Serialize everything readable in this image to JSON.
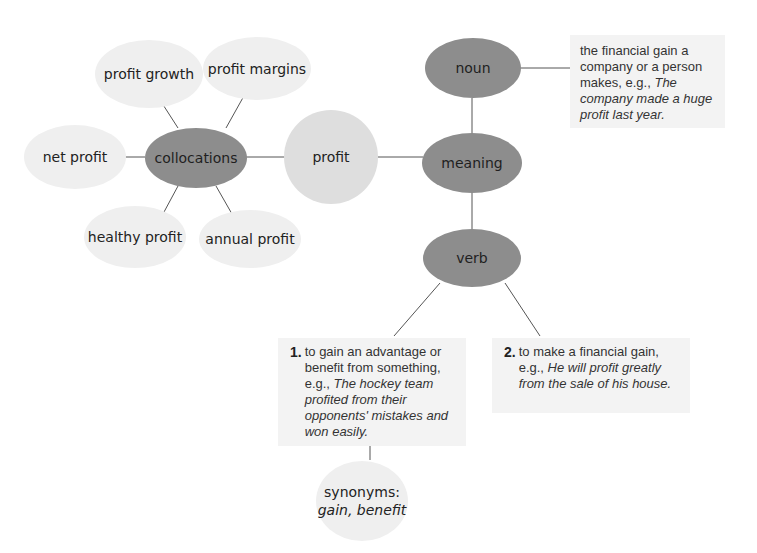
{
  "center": {
    "label": "profit"
  },
  "collocations": {
    "label": "collocations",
    "items": [
      "profit growth",
      "profit margins",
      "net profit",
      "healthy profit",
      "annual profit"
    ]
  },
  "meaning": {
    "label": "meaning",
    "noun": {
      "label": "noun",
      "definition": "the financial gain a company or a person makes, e.g.,",
      "example": "The company made a huge profit last year."
    },
    "verb": {
      "label": "verb",
      "senses": [
        {
          "number": "1.",
          "definition": "to gain an advantage or benefit from something, e.g.,",
          "example": "The hockey team profited from their opponents' mistakes and won easily."
        },
        {
          "number": "2.",
          "definition": "to make a financial gain, e.g.,",
          "example": "He will profit greatly from the sale of his house."
        }
      ]
    }
  },
  "synonyms": {
    "label": "synonyms:",
    "values": "gain, benefit"
  },
  "colors": {
    "light_node": "#efefef",
    "dark_node": "#8d8d8d",
    "center_node": "#dedede",
    "box_bg": "#f3f3f3",
    "line": "#555555"
  }
}
